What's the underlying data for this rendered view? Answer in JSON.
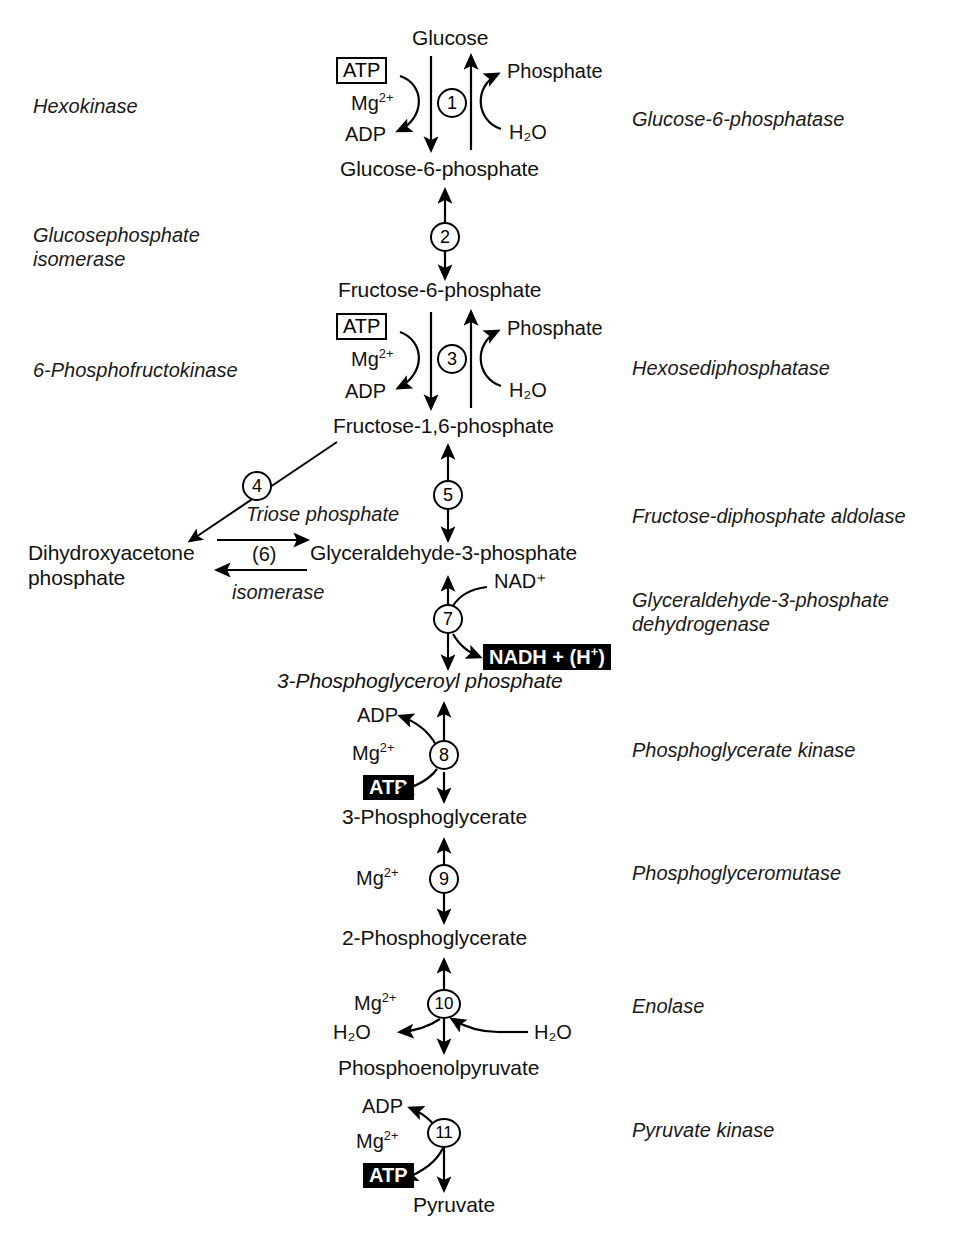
{
  "diagram": {
    "accent_color": "#000000",
    "background_color": "#ffffff"
  },
  "metabolites": [
    {
      "id": "glucose",
      "label": "Glucose"
    },
    {
      "id": "g6p",
      "label": "Glucose-6-phosphate"
    },
    {
      "id": "f6p",
      "label": "Fructose-6-phosphate"
    },
    {
      "id": "f16p",
      "label": "Fructose-1,6-phosphate"
    },
    {
      "id": "dhap_line1",
      "label": "Dihydroxyacetone"
    },
    {
      "id": "dhap_line2",
      "label": "phosphate"
    },
    {
      "id": "g3p",
      "label": "Glyceraldehyde-3-phosphate"
    },
    {
      "id": "bpg",
      "label": "3-Phosphoglyceroyl phosphate"
    },
    {
      "id": "pg3",
      "label": "3-Phosphoglycerate"
    },
    {
      "id": "pg2",
      "label": "2-Phosphoglycerate"
    },
    {
      "id": "pep",
      "label": "Phosphoenolpyruvate"
    },
    {
      "id": "pyruvate",
      "label": "Pyruvate"
    }
  ],
  "enzymes_left": [
    {
      "id": "hexokinase",
      "label": "Hexokinase"
    },
    {
      "id": "gpi_line1",
      "label": "Glucosephosphate"
    },
    {
      "id": "gpi_line2",
      "label": "isomerase"
    },
    {
      "id": "pfk",
      "label": "6-Phosphofructokinase"
    }
  ],
  "enzymes_right": [
    {
      "id": "g6pase",
      "label": "Glucose-6-phosphatase"
    },
    {
      "id": "hexosediphosphatase",
      "label": "Hexosediphosphatase"
    },
    {
      "id": "aldolase",
      "label": "Fructose-diphosphate aldolase"
    },
    {
      "id": "gapdh_line1",
      "label": "Glyceraldehyde-3-phosphate"
    },
    {
      "id": "gapdh_line2",
      "label": "dehydrogenase"
    },
    {
      "id": "pgk",
      "label": "Phosphoglycerate kinase"
    },
    {
      "id": "pgm",
      "label": "Phosphoglyceromutase"
    },
    {
      "id": "enolase",
      "label": "Enolase"
    },
    {
      "id": "pyruvate_kinase",
      "label": "Pyruvate kinase"
    }
  ],
  "inline_enzymes": [
    {
      "id": "triose_phosphate",
      "label": "Triose phosphate"
    },
    {
      "id": "isomerase",
      "label": "isomerase"
    }
  ],
  "steps": [
    {
      "number": "1"
    },
    {
      "number": "2"
    },
    {
      "number": "3"
    },
    {
      "number": "4"
    },
    {
      "number": "5"
    },
    {
      "number": "7"
    },
    {
      "number": "8"
    },
    {
      "number": "9"
    },
    {
      "number": "10"
    },
    {
      "number": "11"
    }
  ],
  "step_plain": {
    "six": "(6)"
  },
  "cofactors": {
    "atp_1": "ATP",
    "mg_1": "Mg",
    "mg_charge": "2+",
    "adp_1": "ADP",
    "phosphate_1": "Phosphate",
    "water_1": "H",
    "water_sub": "2",
    "water_end": "O",
    "atp_3": "ATP",
    "mg_3": "Mg",
    "adp_3": "ADP",
    "phosphate_3": "Phosphate",
    "water_3": "H₂O",
    "nad_plus": "NAD",
    "nad_sup": "+",
    "nadh_box": "NADH + (H",
    "nadh_sup": "+",
    "nadh_close": ")",
    "adp_8": "ADP",
    "mg_8": "Mg",
    "atp_8": "ATP",
    "mg_9": "Mg",
    "mg_10": "Mg",
    "water_10_left": "H₂O",
    "water_10_right": "H₂O",
    "adp_11": "ADP",
    "mg_11": "Mg",
    "atp_11": "ATP"
  },
  "labels": {
    "h2o_text": "H₂O",
    "nad_text": "NAD⁺",
    "mg_text": "Mg²⁺"
  }
}
